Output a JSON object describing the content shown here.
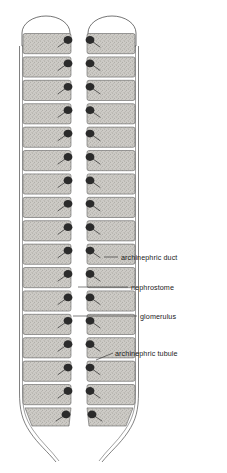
{
  "figure": {
    "background_color": "#ffffff",
    "ink_color": "#2b2b2b",
    "segment_fill": "#c9c7c2",
    "canvas": {
      "width": 227,
      "height": 473
    }
  },
  "labels": [
    {
      "id": "archinephric-duct",
      "text": "archinephric duct",
      "text_x": 121,
      "text_y": 260,
      "leader": "M 118 257 L 104 257",
      "target": "archinephric duct (outer longitudinal line)"
    },
    {
      "id": "nephrostome",
      "text": "nephrostome",
      "text_x": 131,
      "text_y": 290,
      "leader": "M 128 287 L 78 287",
      "target": "nephrostome (ciliated funnel)"
    },
    {
      "id": "glomerulus",
      "text": "glomerulus",
      "text_x": 140,
      "text_y": 319,
      "leader": "M 137 316 L 73 316",
      "target": "glomerulus (dark vascular tuft)"
    },
    {
      "id": "archinephric-tubule",
      "text": "archinephric tubule",
      "text_x": 115,
      "text_y": 356,
      "leader": "M 113 353 L 96 360",
      "target": "archinephric tubule (segment body)"
    }
  ],
  "columns": [
    {
      "id": "left-column",
      "side": "left",
      "x": 19,
      "width": 54,
      "blob_side": "right",
      "duct_side": "left",
      "segment_count": 17
    },
    {
      "id": "right-column",
      "side": "right",
      "x": 85,
      "width": 54,
      "blob_side": "left",
      "duct_side": "right",
      "segment_count": 17
    }
  ],
  "segments": {
    "first_top": 33,
    "pitch": 23.4,
    "height": 20.2,
    "count": 17,
    "description": "stippled rectangular archinephric tubule blocks"
  },
  "caps": [
    {
      "id": "left-cap",
      "cx": 46,
      "cy": 32,
      "rx": 24,
      "ry": 17
    },
    {
      "id": "right-cap",
      "cx": 112,
      "cy": 32,
      "rx": 24,
      "ry": 17
    }
  ]
}
